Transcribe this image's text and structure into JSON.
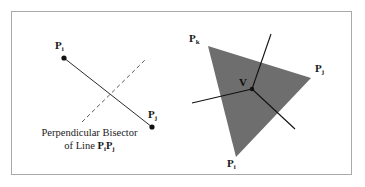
{
  "figure": {
    "background_color": "#ffffff",
    "frame_color": "#a9a9a9",
    "ink_color": "#1a1a1a",
    "triangle_fill_color": "#6e6e6e"
  },
  "left_panel": {
    "name": "perpendicular-bisector-diagram",
    "point_labels": {
      "pi": "P",
      "pi_sub": "i",
      "pj": "P",
      "pj_sub": "j"
    },
    "caption": {
      "line1": "Perpendicular Bisector",
      "line2_prefix": "of Line ",
      "line2_p1": "P",
      "line2_p1_sub": "i",
      "line2_p2": "P",
      "line2_p2_sub": "j"
    },
    "geometry": {
      "point_i": [
        64,
        58
      ],
      "point_j": [
        152,
        127
      ],
      "segment": [
        [
          64,
          58
        ],
        [
          152,
          127
        ]
      ],
      "bisector_dashed": [
        [
          82,
          122
        ],
        [
          145,
          60
        ]
      ]
    }
  },
  "right_panel": {
    "name": "circumcenter-triangle-diagram",
    "point_labels": {
      "pk": "P",
      "pk_sub": "k",
      "pj": "P",
      "pj_sub": "j",
      "pi": "P",
      "pi_sub": "i",
      "v": "V"
    },
    "geometry": {
      "triangle_vertices": [
        [
          208,
          46
        ],
        [
          311,
          78
        ],
        [
          236,
          157
        ]
      ],
      "vertex_v": [
        252,
        89
      ],
      "ray_up": [
        [
          252,
          89
        ],
        [
          271,
          34
        ]
      ],
      "ray_left": [
        [
          252,
          89
        ],
        [
          192,
          103
        ]
      ],
      "ray_down_right": [
        [
          252,
          89
        ],
        [
          295,
          129
        ]
      ]
    }
  }
}
